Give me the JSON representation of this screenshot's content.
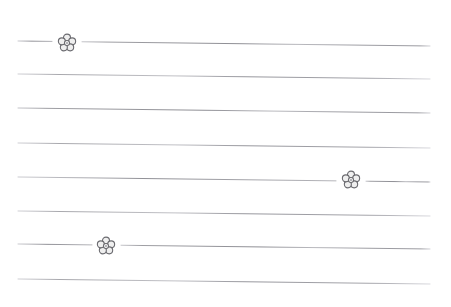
{
  "document": {
    "kind": "ruled-stationery-sheet",
    "title": "Lined Writing Paper with Flower Doodles",
    "width": 451,
    "height": 307,
    "background_color": "#ffffff",
    "content_text": ""
  },
  "style": {
    "rule_color": "#a3a3a8",
    "rule_color_faint": "#c8c8cd",
    "rule_thickness": 1,
    "flower_stroke_color": "#6b6b70",
    "flower_fill_color": "#efefef",
    "flower_center_color": "#9a9a9f"
  },
  "rules": [
    {
      "index": 1,
      "label": "rule-line-1",
      "x_start": 18,
      "y_start": 41,
      "x_end": 430,
      "y_end": 46,
      "gap_start": 52,
      "gap_end": 82,
      "has_gap": true
    },
    {
      "index": 2,
      "label": "rule-line-2",
      "x_start": 18,
      "y_start": 74,
      "x_end": 430,
      "y_end": 79,
      "gap_start": 0,
      "gap_end": 0,
      "has_gap": false
    },
    {
      "index": 3,
      "label": "rule-line-3",
      "x_start": 18,
      "y_start": 108,
      "x_end": 430,
      "y_end": 113,
      "gap_start": 0,
      "gap_end": 0,
      "has_gap": false
    },
    {
      "index": 4,
      "label": "rule-line-4",
      "x_start": 18,
      "y_start": 143,
      "x_end": 430,
      "y_end": 148,
      "gap_start": 0,
      "gap_end": 0,
      "has_gap": false
    },
    {
      "index": 5,
      "label": "rule-line-5",
      "x_start": 18,
      "y_start": 177,
      "x_end": 430,
      "y_end": 182,
      "gap_start": 336,
      "gap_end": 366,
      "has_gap": true
    },
    {
      "index": 6,
      "label": "rule-line-6",
      "x_start": 18,
      "y_start": 211,
      "x_end": 430,
      "y_end": 216,
      "gap_start": 0,
      "gap_end": 0,
      "has_gap": false
    },
    {
      "index": 7,
      "label": "rule-line-7",
      "x_start": 18,
      "y_start": 244,
      "x_end": 430,
      "y_end": 249,
      "gap_start": 92,
      "gap_end": 121,
      "has_gap": true
    },
    {
      "index": 8,
      "label": "rule-line-8",
      "x_start": 18,
      "y_start": 279,
      "x_end": 430,
      "y_end": 284,
      "gap_start": 0,
      "gap_end": 0,
      "has_gap": false
    }
  ],
  "flowers": [
    {
      "index": 1,
      "label": "flower-doodle-1",
      "center_x": 67,
      "center_y": 43,
      "petal_count": 5,
      "on_rule": 1
    },
    {
      "index": 2,
      "label": "flower-doodle-2",
      "center_x": 351,
      "center_y": 180,
      "petal_count": 5,
      "on_rule": 5
    },
    {
      "index": 3,
      "label": "flower-doodle-3",
      "center_x": 106,
      "center_y": 246,
      "petal_count": 5,
      "on_rule": 7
    }
  ]
}
